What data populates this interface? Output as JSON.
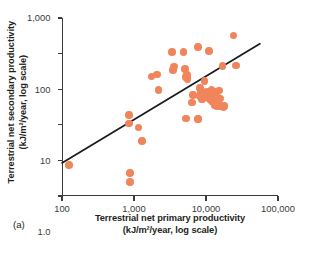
{
  "figure": {
    "panel_label": "(a)",
    "dot_color": "#f0855c",
    "axis_color": "#3b3b3d",
    "line_color": "#1a1a1a"
  },
  "chart_data": {
    "type": "scatter",
    "title": "",
    "xlabel": "Terrestrial net primary productivity",
    "xlabel_units": "(kJ/m²/year, log scale)",
    "ylabel": "Terrestrial net secondary productivity",
    "ylabel_units": "(kJ/m²/year, log scale)",
    "xscale": "log",
    "yscale": "log",
    "xlim": [
      100,
      100000
    ],
    "ylim": [
      0.01,
      1000
    ],
    "grid": false,
    "legend": null,
    "xticks": [
      100,
      1000,
      10000,
      100000
    ],
    "xticklabels": [
      "100",
      "1,000",
      "10,000",
      "100,000"
    ],
    "yticks": [
      0.01,
      0.1,
      1,
      10,
      100,
      1000
    ],
    "yticklabels": [
      "0.01",
      "0.1",
      "1.0",
      "10",
      "100",
      "1,000"
    ],
    "points": [
      [
        125,
        0.075
      ],
      [
        860,
        1.85
      ],
      [
        850,
        1.1
      ],
      [
        880,
        0.045
      ],
      [
        880,
        0.025
      ],
      [
        1150,
        0.85
      ],
      [
        1300,
        0.35
      ],
      [
        1750,
        23
      ],
      [
        2100,
        26
      ],
      [
        2200,
        9.5
      ],
      [
        3400,
        110
      ],
      [
        3500,
        35
      ],
      [
        3600,
        43
      ],
      [
        4900,
        110
      ],
      [
        5100,
        37
      ],
      [
        5200,
        22
      ],
      [
        5400,
        25
      ],
      [
        5500,
        19
      ],
      [
        5300,
        1.5
      ],
      [
        6400,
        4.2
      ],
      [
        6600,
        6.8
      ],
      [
        7600,
        1.45
      ],
      [
        7900,
        1.45
      ],
      [
        7800,
        155
      ],
      [
        8200,
        11
      ],
      [
        8300,
        6.5
      ],
      [
        8500,
        9.0
      ],
      [
        8800,
        5.2
      ],
      [
        9500,
        17
      ],
      [
        9800,
        7.5
      ],
      [
        10200,
        8.4
      ],
      [
        10500,
        6.0
      ],
      [
        10800,
        5.6
      ],
      [
        11000,
        120
      ],
      [
        11200,
        8.0
      ],
      [
        11500,
        7.2
      ],
      [
        11800,
        5.0
      ],
      [
        12000,
        9.5
      ],
      [
        12300,
        6.4
      ],
      [
        12600,
        4.3
      ],
      [
        13000,
        7.8
      ],
      [
        13200,
        3.6
      ],
      [
        13500,
        5.9
      ],
      [
        13800,
        8.6
      ],
      [
        14000,
        3.4
      ],
      [
        14300,
        6.2
      ],
      [
        14800,
        4.0
      ],
      [
        15200,
        9.2
      ],
      [
        15600,
        3.3
      ],
      [
        16000,
        5.5
      ],
      [
        16500,
        3.5
      ],
      [
        17000,
        44
      ],
      [
        17500,
        3.2
      ],
      [
        18000,
        3.4
      ],
      [
        24000,
        320
      ],
      [
        26000,
        46
      ]
    ],
    "trendline": {
      "type": "linear-fit-loglog",
      "x_start": 100,
      "y_start": 0.085,
      "x_end": 56000,
      "y_end": 190
    }
  }
}
